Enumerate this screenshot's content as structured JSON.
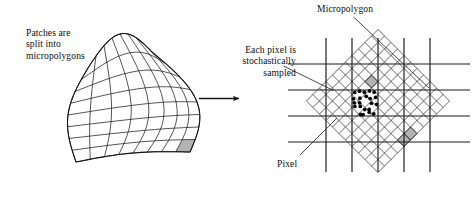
{
  "figure": {
    "labels": {
      "patches": "Patches are\nsplit into\nmicropolygons",
      "each_pixel": "Each pixel is\nstochastically\nsampled",
      "micropolygon": "Micropolygon",
      "pixel": "Pixel"
    },
    "transition_arrow": "→",
    "colors": {
      "ink": "#111111",
      "line": "#1a1a1a",
      "mesh": "#2b2b2b",
      "highlight_fill": "#b3b3b3",
      "sample_dot": "#000000",
      "background": "#ffffff"
    },
    "left_panel": {
      "name": "bezier-patch-subdivided",
      "grid_rows": 8,
      "grid_cols": 8,
      "highlighted_cell": {
        "row": 7,
        "col": 7
      },
      "highlight_color": "#b3b3b3"
    },
    "right_panel": {
      "name": "pixel-grid-with-micropolygon-mesh",
      "pixel_grid": {
        "vertical_lines_x": [
          326,
          352,
          378,
          404,
          430
        ],
        "horizontal_lines_y": [
          64,
          90,
          116,
          142
        ],
        "columns": 4,
        "rows": 3
      },
      "micropolygon_mesh": {
        "rotation_deg": 45,
        "cell_size": 9.2,
        "cells_across": 11,
        "cells_down": 11
      },
      "sample_dots_count": 22,
      "shaded_micropolygons": 2
    }
  }
}
